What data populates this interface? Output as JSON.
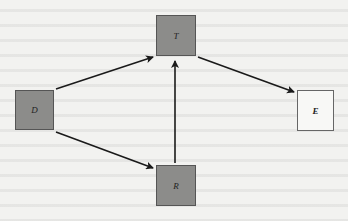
{
  "diagram": {
    "type": "directed-graph",
    "nodes": [
      {
        "id": "T",
        "label": "T",
        "style": "filled",
        "x": 156,
        "y": 15,
        "w": 40,
        "h": 41
      },
      {
        "id": "D",
        "label": "D",
        "style": "filled",
        "x": 15,
        "y": 90,
        "w": 39,
        "h": 40
      },
      {
        "id": "E",
        "label": "E",
        "style": "empty",
        "x": 297,
        "y": 90,
        "w": 37,
        "h": 41
      },
      {
        "id": "R",
        "label": "R",
        "style": "filled",
        "x": 156,
        "y": 165,
        "w": 40,
        "h": 41
      }
    ],
    "edges": [
      {
        "from": "D",
        "to": "T"
      },
      {
        "from": "T",
        "to": "E"
      },
      {
        "from": "R",
        "to": "T"
      },
      {
        "from": "D",
        "to": "R"
      }
    ],
    "colors": {
      "filled_node": "#8c8c8a",
      "empty_node": "#f8f8f6",
      "edge": "#1a1a1a",
      "background": "#f2f2f0"
    }
  }
}
